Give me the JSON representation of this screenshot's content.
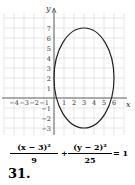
{
  "problem": {
    "number": "31.",
    "equation": {
      "term1_numerator": "(x − 3)²",
      "term1_denominator": "9",
      "plus": "+",
      "term2_numerator": "(y − 2)²",
      "term2_denominator": "25",
      "equals": "= 1"
    }
  },
  "chart_data": {
    "type": "line",
    "title": "",
    "xlabel": "x",
    "ylabel": "y",
    "xlim": [
      -5,
      7
    ],
    "ylim": [
      -3.7,
      8.5
    ],
    "grid": true,
    "x_ticks": [
      -4,
      -3,
      -2,
      -1,
      1,
      2,
      3,
      4,
      5,
      6
    ],
    "x_tick_labels": [
      "−4",
      "−3",
      "−2",
      "−1",
      "1",
      "2",
      "3",
      "4",
      "5",
      "6"
    ],
    "y_ticks": [
      -3,
      -2,
      -1,
      1,
      2,
      3,
      4,
      5,
      6,
      7
    ],
    "y_tick_labels": [
      "−3",
      "−2",
      "−1",
      "1",
      "2",
      "3",
      "4",
      "5",
      "6",
      "7"
    ],
    "series": [
      {
        "name": "ellipse",
        "shape": "ellipse",
        "center": [
          3,
          2
        ],
        "semi_axis_x": 3,
        "semi_axis_y": 5,
        "color": "#222222"
      }
    ],
    "colors": {
      "grid": "#d6d6d6",
      "axis": "#555555",
      "curve": "#222222",
      "text": "#333333"
    }
  }
}
